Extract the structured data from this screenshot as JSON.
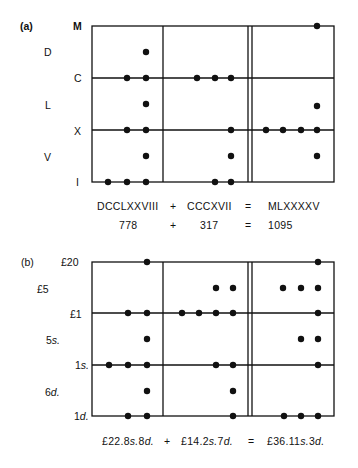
{
  "panel_a": {
    "tag": "(a)",
    "row_labels_outer": [
      "M",
      "C",
      "X",
      "I"
    ],
    "row_labels_inner": [
      "D",
      "L",
      "V"
    ],
    "equation_roman": {
      "left": "DCCLXXVIII",
      "plus": "+",
      "right": "CCCXVII",
      "equals": "=",
      "result": "MLXXXXV"
    },
    "equation_arabic": {
      "left": "778",
      "plus": "+",
      "right": "317",
      "equals": "=",
      "result": "1095"
    },
    "columns": [
      {
        "name": "addend-1",
        "value": "DCCLXXVIII",
        "counters": {
          "M": 0,
          "D": 1,
          "C": 2,
          "L": 1,
          "X": 2,
          "V": 1,
          "I": 3
        }
      },
      {
        "name": "addend-2",
        "value": "CCCXVII",
        "counters": {
          "M": 0,
          "D": 0,
          "C": 3,
          "L": 0,
          "X": 1,
          "V": 1,
          "I": 2
        }
      },
      {
        "name": "sum",
        "value": "MLXXXXV",
        "counters": {
          "M": 1,
          "D": 0,
          "C": 0,
          "L": 1,
          "X": 4,
          "V": 1,
          "I": 0
        }
      }
    ]
  },
  "panel_b": {
    "tag": "(b)",
    "row_labels": {
      "r20": "£20",
      "r5": "£5",
      "r1": "£1",
      "s5": "5",
      "s1": "1",
      "d6": "6",
      "d1": "1"
    },
    "unit_s": "s.",
    "unit_d": "d.",
    "equation": {
      "left_pounds": "£22.8",
      "left_s_val": "8",
      "left_d_unit": "d.",
      "plus": "+",
      "right_pounds": "£14.2",
      "right_d_val": "7",
      "equals": "=",
      "result_pounds": "£36.11",
      "result_d_val": "3",
      "s_unit": "s.",
      "d_unit": "d.",
      "left_text": "£22.8s.8d.",
      "right_text": "£14.2s.7d.",
      "result_text": "£36.11s.3d."
    },
    "columns": [
      {
        "name": "addend-1",
        "value": "£22.8s.8d.",
        "counters": {
          "£20": 1,
          "£5": 0,
          "£1": 2,
          "5s.": 1,
          "1s.": 3,
          "6d.": 1,
          "1d.": 2
        }
      },
      {
        "name": "addend-2",
        "value": "£14.2s.7d.",
        "counters": {
          "£20": 0,
          "£5": 2,
          "£1": 4,
          "5s.": 0,
          "1s.": 2,
          "6d.": 1,
          "1d.": 1
        }
      },
      {
        "name": "sum",
        "value": "£36.11s.3d.",
        "counters": {
          "£20": 1,
          "£5": 3,
          "£1": 1,
          "5s.": 2,
          "1s.": 1,
          "6d.": 0,
          "1d.": 3
        }
      }
    ]
  },
  "colors": {
    "ink": "#111111",
    "background": "#ffffff"
  }
}
